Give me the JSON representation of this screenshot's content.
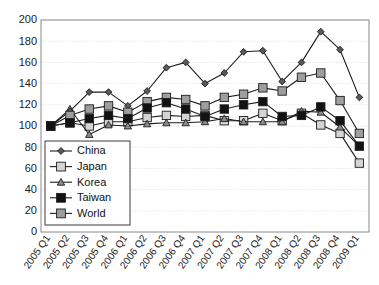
{
  "chart_data": {
    "type": "line",
    "title": "",
    "subtitle": "",
    "xlabel": "",
    "ylabel": "",
    "ylim": [
      0,
      200
    ],
    "ytick_step": 20,
    "yticks": [
      0,
      20,
      40,
      60,
      80,
      100,
      120,
      140,
      160,
      180,
      200
    ],
    "grid": true,
    "legend_position": "inside-lower-left",
    "categories": [
      "2005 Q1",
      "2005 Q2",
      "2005 Q3",
      "2005 Q4",
      "2006 Q1",
      "2006 Q2",
      "2006 Q3",
      "2006 Q4",
      "2007 Q1",
      "2007 Q2",
      "2007 Q3",
      "2007 Q4",
      "2008 Q1",
      "2008 Q2",
      "2008 Q3",
      "2008 Q4",
      "2009 Q1"
    ],
    "series": [
      {
        "name": "China",
        "marker": "diamond",
        "color": "#5a5a5a",
        "values": [
          100,
          114,
          132,
          132,
          119,
          133,
          155,
          160,
          140,
          150,
          170,
          171,
          142,
          160,
          189,
          172,
          127
        ]
      },
      {
        "name": "Japan",
        "marker": "square",
        "color": "#d4d4d4",
        "values": [
          100,
          103,
          100,
          104,
          104,
          108,
          110,
          109,
          110,
          105,
          105,
          112,
          105,
          112,
          101,
          93,
          65
        ]
      },
      {
        "name": "Korea",
        "marker": "triangle",
        "color": "#8c8c8c",
        "values": [
          100,
          116,
          92,
          101,
          100,
          102,
          103,
          103,
          104,
          107,
          104,
          104,
          104,
          114,
          113,
          99,
          81
        ]
      },
      {
        "name": "Taiwan",
        "marker": "square",
        "color": "#121212",
        "values": [
          100,
          103,
          107,
          110,
          107,
          117,
          122,
          116,
          109,
          116,
          120,
          123,
          109,
          110,
          118,
          105,
          81
        ]
      },
      {
        "name": "World",
        "marker": "square",
        "color": "#9e9e9e",
        "values": [
          100,
          110,
          116,
          119,
          113,
          123,
          127,
          125,
          119,
          127,
          130,
          136,
          133,
          146,
          150,
          124,
          93
        ]
      }
    ]
  },
  "legend": {
    "items": [
      {
        "label": "China"
      },
      {
        "label": "Japan"
      },
      {
        "label": "Korea"
      },
      {
        "label": "Taiwan"
      },
      {
        "label": "World"
      }
    ]
  },
  "colors": {
    "background": "#ffffff",
    "axis": "#8a8a8a",
    "grid": "#d9d9d9",
    "line": "#1d1d1d",
    "text": "#1a1a1a"
  }
}
